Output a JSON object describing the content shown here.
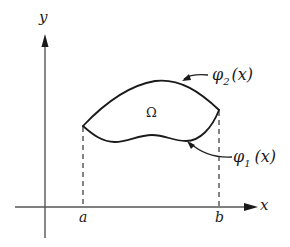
{
  "diagram": {
    "axes": {
      "x_label": "x",
      "y_label": "y"
    },
    "ticks": {
      "a_label": "a",
      "b_label": "b"
    },
    "region": {
      "label": "Ω"
    },
    "curves": {
      "upper": {
        "symbol": "φ",
        "subscript": "2",
        "argument": "(x)",
        "description": "upper boundary curve"
      },
      "lower": {
        "symbol": "φ",
        "subscript": "1",
        "argument": "(x)",
        "description": "lower boundary curve"
      }
    },
    "colors": {
      "ink": "#1a1a1a",
      "axis": "#555555",
      "background": "#ffffff"
    }
  }
}
